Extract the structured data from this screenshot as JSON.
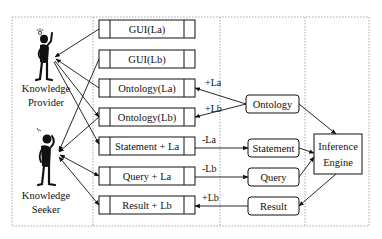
{
  "diagram": {
    "type": "architecture",
    "actors": [
      {
        "id": "provider",
        "label_line1": "Knowledge",
        "label_line2": "Provider"
      },
      {
        "id": "seeker",
        "label_line1": "Knowledge",
        "label_line2": "Seeker"
      }
    ],
    "components": [
      {
        "id": "gui_la",
        "label": "GUI(La)"
      },
      {
        "id": "gui_lb",
        "label": "GUI(Lb)"
      },
      {
        "id": "ont_la",
        "label": "Ontology(La)"
      },
      {
        "id": "ont_lb",
        "label": "Ontology(Lb)"
      },
      {
        "id": "stmt_la",
        "label": "Statement + La"
      },
      {
        "id": "query_la",
        "label": "Query + La"
      },
      {
        "id": "result_lb",
        "label": "Result + Lb"
      }
    ],
    "resources": [
      {
        "id": "ontology",
        "label": "Ontology"
      },
      {
        "id": "statement",
        "label": "Statement"
      },
      {
        "id": "query",
        "label": "Query"
      },
      {
        "id": "result",
        "label": "Result"
      }
    ],
    "engine": {
      "label_line1": "Inference",
      "label_line2": "Engine"
    },
    "edge_labels": {
      "ont_to_la": "+La",
      "ont_to_lb": "+Lb",
      "stmt_out": "-La",
      "query_out": "-Lb",
      "result_in": "+Lb"
    },
    "colors": {
      "line": "#111111",
      "dotted_border": "#a8a8a8",
      "background": "#ffffff"
    }
  }
}
